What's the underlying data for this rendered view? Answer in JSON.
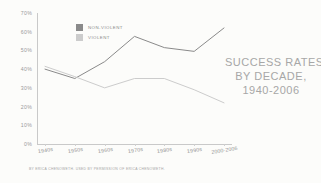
{
  "title": {
    "line1": "SUCCESS RATES",
    "line2": "BY DECADE,",
    "line3": "1940-2006"
  },
  "credit": "BY ERICA CHENOWETH. USED BY PERMISSION OF ERICA CHENOWETH.",
  "colors": {
    "nonviolent": "#8a8a8a",
    "violent": "#cccccc",
    "axis": "#c9c9c9",
    "text": "#9a9a9a",
    "title": "#a7a7a7",
    "background": "#fcfcfa"
  },
  "legend": [
    {
      "label": "NON-VIOLENT",
      "color": "#8a8a8a"
    },
    {
      "label": "VIOLENT",
      "color": "#cccccc"
    }
  ],
  "chart_data": {
    "type": "line",
    "title": "SUCCESS RATES BY DECADE, 1940-2006",
    "xlabel": "",
    "ylabel": "",
    "categories": [
      "1940s",
      "1950s",
      "1960s",
      "1970s",
      "1980s",
      "1990s",
      "2000-2006"
    ],
    "series": [
      {
        "name": "NON-VIOLENT",
        "color": "#8a8a8a",
        "values": [
          40,
          35,
          44,
          57.5,
          51.5,
          49.5,
          62
        ]
      },
      {
        "name": "VIOLENT",
        "color": "#cccccc",
        "values": [
          41.5,
          36,
          30,
          35,
          35,
          29,
          22
        ]
      }
    ],
    "ylim": [
      0,
      70
    ],
    "yticks": [
      0,
      10,
      20,
      30,
      40,
      50,
      60,
      70
    ],
    "ytick_labels": [
      "0%",
      "10%",
      "20%",
      "30%",
      "40%",
      "50%",
      "60%",
      "70%"
    ],
    "grid": false,
    "legend_position": "top-left-inside"
  }
}
